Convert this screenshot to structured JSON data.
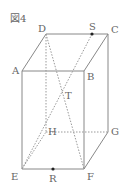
{
  "title": "図4",
  "colors": {
    "line": "#888888",
    "dashed": "#999999",
    "point": "#222222",
    "text": "#666666"
  },
  "vertices": {
    "A": {
      "label": "A",
      "x": 22,
      "y": 71
    },
    "B": {
      "label": "B",
      "x": 84,
      "y": 71
    },
    "C": {
      "label": "C",
      "x": 108,
      "y": 34
    },
    "D": {
      "label": "D",
      "x": 46,
      "y": 34
    },
    "E": {
      "label": "E",
      "x": 22,
      "y": 169
    },
    "F": {
      "label": "F",
      "x": 84,
      "y": 169
    },
    "G": {
      "label": "G",
      "x": 108,
      "y": 132
    },
    "H": {
      "label": "H",
      "x": 46,
      "y": 132
    }
  },
  "points": {
    "S": {
      "label": "S",
      "x": 92,
      "y": 34,
      "on": "DC"
    },
    "R": {
      "label": "R",
      "x": 53,
      "y": 169,
      "on": "EF"
    },
    "T": {
      "label": "T",
      "x": 63,
      "y": 92,
      "on": "DF ∩ SE"
    }
  },
  "solid_edges": [
    "AB",
    "BC",
    "CD",
    "DA",
    "AE",
    "BF",
    "CG",
    "EF",
    "FG"
  ],
  "hidden_edges": [
    "DH",
    "EH",
    "HG"
  ],
  "auxiliary_lines": [
    "DF",
    "SE"
  ]
}
